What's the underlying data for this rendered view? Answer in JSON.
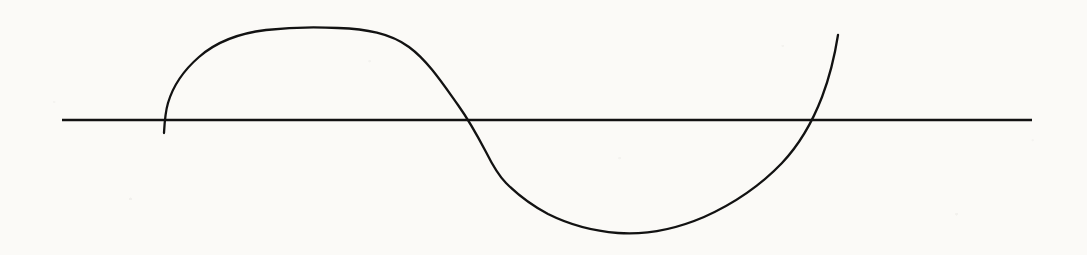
{
  "figure": {
    "title": "",
    "background_color": "#fbfaf7",
    "ink_color": "#121212",
    "width": 1087,
    "height": 255
  },
  "axis": {
    "name": "horizontal-axis",
    "label": "",
    "color": "#121212",
    "thickness": 2.6,
    "y": 120,
    "x_start": 62,
    "x_end": 1032
  },
  "curve": {
    "name": "s-curve",
    "label": "",
    "color": "#121212",
    "thickness": 2.3,
    "start_point": "(164, 133)",
    "end_point": "(838, 35)",
    "path": "M 164 133 C 164.5 124 165 113 168 103 C 173 86 184 70 199 57 C 216 42 241 33 266 30 C 292 27 318 27 338 28 C 366 29 390 33 409 47 C 428 61 443 84 458 105 C 468 119 476 133 486 152 C 493 166 499 176 506 183 C 517 194 531 205 548 214 C 568 224 592 231 618 233 C 646 235 676 229 704 217 C 733 204 760 186 782 163 C 798 146 812 123 822 97 C 830 76 835 54 838 35"
  },
  "chart_data": {
    "type": "line",
    "title": "",
    "subtitle": "",
    "xlabel": "",
    "ylabel": "",
    "legend": [],
    "grid": false,
    "axis_line": "horizontal zero line only",
    "xlim": [
      62,
      1032
    ],
    "ylim_pixels": [
      255,
      0
    ],
    "zero_line_y_pixels": 120,
    "series": [
      {
        "name": "curve",
        "points_pixels": [
          [
            164,
            133
          ],
          [
            180,
            96
          ],
          [
            200,
            72
          ],
          [
            225,
            50
          ],
          [
            255,
            36
          ],
          [
            290,
            29
          ],
          [
            320,
            27
          ],
          [
            340,
            27
          ],
          [
            365,
            30
          ],
          [
            390,
            39
          ],
          [
            410,
            52
          ],
          [
            430,
            71
          ],
          [
            450,
            95
          ],
          [
            466,
            112
          ],
          [
            477,
            120
          ],
          [
            490,
            150
          ],
          [
            505,
            182
          ],
          [
            525,
            198
          ],
          [
            550,
            213
          ],
          [
            580,
            225
          ],
          [
            610,
            232
          ],
          [
            625,
            233
          ],
          [
            655,
            231
          ],
          [
            690,
            222
          ],
          [
            720,
            209
          ],
          [
            750,
            193
          ],
          [
            775,
            173
          ],
          [
            795,
            148
          ],
          [
            810,
            118
          ],
          [
            822,
            90
          ],
          [
            832,
            58
          ],
          [
            838,
            35
          ]
        ],
        "zero_crossings_pixels": [
          477,
          807
        ],
        "peak_pixels": [
          335,
          27
        ],
        "trough_pixels": [
          622,
          233
        ]
      }
    ],
    "annotations": []
  }
}
